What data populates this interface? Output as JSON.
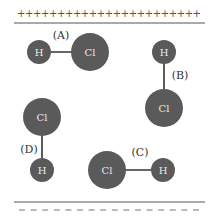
{
  "diagram": {
    "colors": {
      "atom_fill": "#5a5a5a",
      "bond": "#333333",
      "plate_line": "#555555",
      "atom_text": "#e8e8e8"
    },
    "top_plate": {
      "charge_symbols": "+++++++++++++++++++++++",
      "charge": "positive"
    },
    "bottom_plate": {
      "charge": "negative",
      "dash_count": 16
    },
    "molecules": [
      {
        "label": "(A)",
        "orientation": "horizontal, H left, Cl right",
        "atoms": [
          {
            "symbol": "H",
            "cx": 39,
            "cy": 52,
            "r": 12
          },
          {
            "symbol": "Cl",
            "cx": 90,
            "cy": 52,
            "r": 19
          }
        ],
        "label_pos": {
          "x": 61,
          "y": 35
        }
      },
      {
        "label": "(B)",
        "orientation": "vertical, H top, Cl bottom",
        "atoms": [
          {
            "symbol": "H",
            "cx": 164,
            "cy": 52,
            "r": 12
          },
          {
            "symbol": "Cl",
            "cx": 164,
            "cy": 108,
            "r": 19
          }
        ],
        "label_pos": {
          "x": 180,
          "y": 75
        }
      },
      {
        "label": "(C)",
        "orientation": "horizontal, Cl left, H right",
        "atoms": [
          {
            "symbol": "Cl",
            "cx": 107,
            "cy": 170,
            "r": 19
          },
          {
            "symbol": "H",
            "cx": 163,
            "cy": 170,
            "r": 12
          }
        ],
        "label_pos": {
          "x": 140,
          "y": 152
        }
      },
      {
        "label": "(D)",
        "orientation": "vertical, Cl top, H bottom",
        "atoms": [
          {
            "symbol": "Cl",
            "cx": 42,
            "cy": 117,
            "r": 19
          },
          {
            "symbol": "H",
            "cx": 42,
            "cy": 170,
            "r": 12
          }
        ],
        "label_pos": {
          "x": 29,
          "y": 149
        }
      }
    ]
  }
}
